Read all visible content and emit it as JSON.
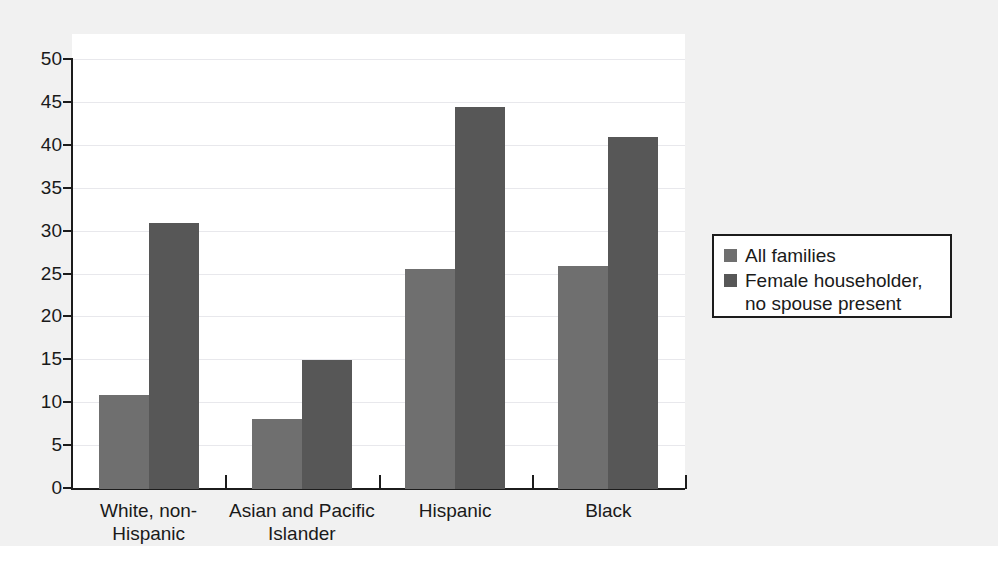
{
  "chart_data": {
    "type": "bar",
    "title": "",
    "subtitle": "",
    "xlabel": "",
    "ylabel": "",
    "ylim": [
      0,
      50
    ],
    "yticks": [
      0,
      5,
      10,
      15,
      20,
      25,
      30,
      35,
      40,
      45,
      50
    ],
    "ytick_labels": [
      "0",
      "5",
      "10",
      "15",
      "20",
      "25",
      "30",
      "35",
      "40",
      "45",
      "50"
    ],
    "grid": true,
    "grid_axis": "y",
    "legend_position": "right",
    "categories": [
      "White, non-\nHispanic",
      "Asian and Pacific\nIslander",
      "Hispanic",
      "Black"
    ],
    "series": [
      {
        "name": "All families",
        "color": "#6f6f6f",
        "values": [
          11.0,
          8.2,
          25.6,
          26.0
        ]
      },
      {
        "name": "Female householder,\nno spouse present",
        "color": "#575757",
        "values": [
          31.0,
          15.0,
          44.5,
          41.0
        ]
      }
    ]
  },
  "legend": {
    "entries": [
      {
        "label": "All families",
        "color": "#6f6f6f"
      },
      {
        "label": "Female householder,\nno spouse present",
        "color": "#575757"
      }
    ]
  },
  "axis": {
    "y_tick_labels": [
      "50",
      "45",
      "40",
      "35",
      "30",
      "25",
      "20",
      "15",
      "10",
      "5",
      "0"
    ],
    "x_category_labels": [
      "White, non-\nHispanic",
      "Asian and Pacific\nIslander",
      "Hispanic",
      "Black"
    ]
  },
  "colors": {
    "series_light": "#6f6f6f",
    "series_dark": "#575757",
    "axis": "#1c1c1c",
    "gridline": "#e8e8ec",
    "canvas_background": "#f1f1f1",
    "plot_background": "#ffffff"
  }
}
